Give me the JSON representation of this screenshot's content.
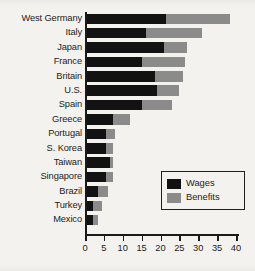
{
  "chart_data": {
    "type": "bar",
    "orientation": "horizontal",
    "stacked": true,
    "title": "",
    "xlabel": "",
    "ylabel": "",
    "xlim": [
      0,
      40
    ],
    "xticks": [
      0,
      5,
      10,
      15,
      20,
      25,
      30,
      35,
      40
    ],
    "xtick_labels": [
      "0",
      "5",
      "10",
      "15",
      "20",
      "25",
      "30",
      "35",
      "40"
    ],
    "grid": false,
    "legend_position": "center-right",
    "categories": [
      "West Germany",
      "Italy",
      "Japan",
      "France",
      "Britain",
      "U.S.",
      "Spain",
      "Greece",
      "Portugal",
      "S. Korea",
      "Taiwan",
      "Singapore",
      "Brazil",
      "Turkey",
      "Mexico"
    ],
    "series": [
      {
        "name": "Wages",
        "color": "#121212",
        "values": [
          21.0,
          15.5,
          20.5,
          14.5,
          18.0,
          18.5,
          14.5,
          7.0,
          5.0,
          5.0,
          6.0,
          5.0,
          3.0,
          1.5,
          1.5
        ]
      },
      {
        "name": "Benefits",
        "color": "#8b8b8b",
        "values": [
          17.0,
          15.0,
          6.0,
          11.5,
          7.5,
          6.0,
          8.0,
          4.5,
          2.5,
          2.0,
          1.0,
          2.0,
          2.5,
          2.5,
          1.5
        ]
      }
    ],
    "totals": [
      38.0,
      30.5,
      26.5,
      26.0,
      25.5,
      24.5,
      22.5,
      11.5,
      7.5,
      7.0,
      7.0,
      7.0,
      5.5,
      4.0,
      3.0
    ]
  },
  "legend": {
    "items": [
      {
        "label": "Wages",
        "swatch": "wages-swatch"
      },
      {
        "label": "Benefits",
        "swatch": "benefits-swatch"
      }
    ]
  },
  "colors": {
    "wages": "#121212",
    "benefits": "#8b8b8b",
    "axis": "#1a1a1a",
    "background": "#f4f2ef",
    "text": "#1b1b1b"
  }
}
